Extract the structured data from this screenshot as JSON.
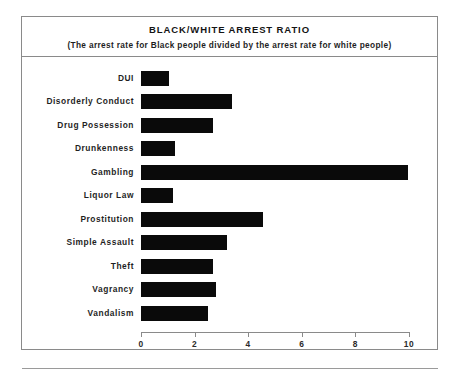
{
  "chart_data": {
    "type": "bar",
    "orientation": "horizontal",
    "title": "BLACK/WHITE ARREST RATIO",
    "subtitle": "(The arrest rate for Black people divided by the arrest rate for white people)",
    "xlabel": "",
    "ylabel": "",
    "xlim": [
      0,
      10
    ],
    "grid": false,
    "legend": false,
    "bar_color": "#0a0a0a",
    "frame_color": "#8a8a8a",
    "tick_labels": [
      "0",
      "2",
      "4",
      "6",
      "8",
      "10"
    ],
    "tick_values": [
      0,
      2,
      4,
      6,
      8,
      10
    ],
    "categories": [
      "DUI",
      "Disorderly Conduct",
      "Drug Possession",
      "Drunkenness",
      "Gambling",
      "Liquor Law",
      "Prostitution",
      "Simple Assault",
      "Theft",
      "Vagrancy",
      "Vandalism"
    ],
    "values": [
      1.05,
      3.4,
      2.7,
      1.25,
      9.95,
      1.2,
      4.55,
      3.2,
      2.7,
      2.8,
      2.5
    ]
  }
}
